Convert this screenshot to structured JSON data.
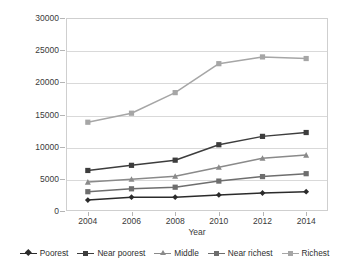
{
  "chart_data": {
    "type": "line",
    "title": "",
    "xlabel": "Year",
    "ylabel": "",
    "categories": [
      "2004",
      "2006",
      "2008",
      "2010",
      "2012",
      "2014"
    ],
    "x": [
      2004,
      2006,
      2008,
      2010,
      2012,
      2014
    ],
    "ylim": [
      0,
      30000
    ],
    "yticks": [
      "0",
      "5000",
      "10000",
      "15000",
      "20000",
      "25000",
      "30000"
    ],
    "ytick_values": [
      0,
      5000,
      10000,
      15000,
      20000,
      25000,
      30000
    ],
    "grid": true,
    "legend_position": "bottom",
    "series": [
      {
        "name": "Poorest",
        "values": [
          1700,
          2150,
          2150,
          2500,
          2800,
          3000
        ],
        "color": "#2b2b2b",
        "marker": "diamond"
      },
      {
        "name": "Near poorest",
        "values": [
          6300,
          7100,
          7900,
          10300,
          11600,
          12200
        ],
        "color": "#3d3d3d",
        "marker": "square"
      },
      {
        "name": "Middle",
        "values": [
          4500,
          4950,
          5400,
          6800,
          8200,
          8700
        ],
        "color": "#8a8a8a",
        "marker": "triangle"
      },
      {
        "name": "Near richest",
        "values": [
          3000,
          3450,
          3700,
          4650,
          5350,
          5800
        ],
        "color": "#6e6e6e",
        "marker": "square"
      },
      {
        "name": "Richest",
        "values": [
          13800,
          15200,
          18400,
          22900,
          23950,
          23700
        ],
        "color": "#a6a6a6",
        "marker": "square"
      }
    ]
  }
}
